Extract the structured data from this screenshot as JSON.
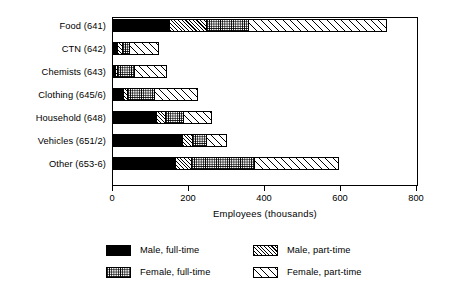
{
  "chart_data": {
    "type": "bar",
    "orientation": "horizontal",
    "stacked": true,
    "title": "",
    "xlabel": "Employees (thousands)",
    "ylabel": "",
    "xlim": [
      0,
      800
    ],
    "xticks": [
      0,
      200,
      400,
      600,
      800
    ],
    "xtick_labels": [
      "0",
      "200",
      "400",
      "600",
      "800"
    ],
    "grid": false,
    "legend_position": "bottom",
    "categories": [
      "Food (641)",
      "CTN (642)",
      "Chemists (643)",
      "Clothing (645/6)",
      "Household (648)",
      "Vehicles (651/2)",
      "Other (653-6)"
    ],
    "series": [
      {
        "name": "Male, full-time",
        "pattern": "solid-black",
        "values": [
          150,
          14,
          9,
          30,
          115,
          185,
          165
        ]
      },
      {
        "name": "Male, part-time",
        "pattern": "dense-diagonal-hatch",
        "values": [
          100,
          16,
          6,
          13,
          27,
          27,
          46
        ]
      },
      {
        "name": "Female, full-time",
        "pattern": "fine-stipple-dots",
        "values": [
          113,
          19,
          48,
          73,
          49,
          41,
          167
        ]
      },
      {
        "name": "Female, part-time",
        "pattern": "sparse-diagonal-hatch",
        "values": [
          367,
          81,
          87,
          116,
          78,
          54,
          224
        ]
      }
    ],
    "totals": [
      730,
      130,
      150,
      232,
      269,
      307,
      602
    ]
  },
  "legend": {
    "items": [
      {
        "label": "Male, full-time",
        "pattern": "solid-black"
      },
      {
        "label": "Male, part-time",
        "pattern": "dense-diagonal-hatch"
      },
      {
        "label": "Female, full-time",
        "pattern": "fine-stipple-dots"
      },
      {
        "label": "Female, part-time",
        "pattern": "sparse-diagonal-hatch"
      }
    ]
  },
  "axis": {
    "x_title": "Employees (thousands)"
  }
}
